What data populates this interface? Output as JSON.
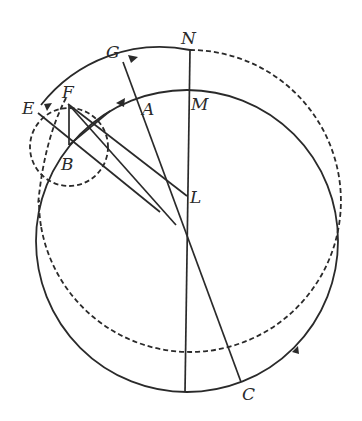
{
  "diagram": {
    "labels": {
      "N": "N",
      "M": "M",
      "G": "G",
      "F": "F",
      "E": "E",
      "A": "A",
      "B": "B",
      "L": "L",
      "C": "C"
    },
    "colors": {
      "ink": "#2a2a2a",
      "background": "#ffffff"
    },
    "elements": [
      "large solid circle (through M, C)",
      "large dashed circle (through N), solid arc from E through F, G to N",
      "small dashed circle centered at B through E and F",
      "vertical line from N to bottom of solid circle",
      "line from G to C",
      "lines from E and F toward L / center",
      "line F-B, line through B and A",
      "direction arrows on arcs"
    ]
  }
}
